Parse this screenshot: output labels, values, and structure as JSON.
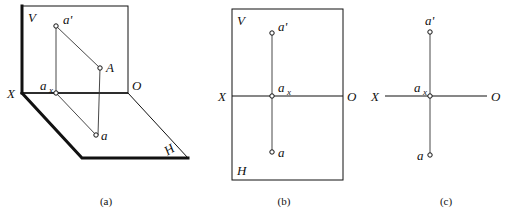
{
  "figure": {
    "background_color": "#ffffff",
    "line_color": "#111111",
    "panels": [
      {
        "id": "a",
        "caption": "(a)",
        "caption_x": 106,
        "caption_y": 205,
        "description": "Pictorial view: vertical plane V and horizontal plane H folded at axis XO",
        "labels": {
          "v_plane": "V",
          "h_plane": "H",
          "x_axis": "X",
          "o_origin": "O",
          "point_space": "A",
          "point_v_projection": "a'",
          "point_h_projection": "a",
          "point_axis": "a",
          "point_axis_sub": "x"
        },
        "points": [
          {
            "name": "a-prime",
            "label": "a'",
            "x": 56,
            "y": 26
          },
          {
            "name": "A",
            "label": "A",
            "x": 100,
            "y": 68
          },
          {
            "name": "a-x",
            "label": "a",
            "sub": "x",
            "x": 56,
            "y": 93
          },
          {
            "name": "a",
            "label": "a",
            "x": 96,
            "y": 135
          }
        ],
        "v_plane_rect": {
          "x1": 22,
          "y1": 6,
          "x2": 128,
          "y2": 93
        },
        "h_plane_points": "22,93 82,158 188,158 128,93",
        "axis_xo": {
          "x1": 22,
          "y1": 93,
          "x2": 128,
          "y2": 93
        }
      },
      {
        "id": "b",
        "caption": "(b)",
        "caption_x": 284,
        "caption_y": 205,
        "description": "Unfolded planes shown as one rectangle with axis XO across the middle",
        "labels": {
          "v_plane": "V",
          "h_plane": "H",
          "x_axis": "X",
          "o_origin": "O",
          "point_v_projection": "a'",
          "point_h_projection": "a",
          "point_axis": "a",
          "point_axis_sub": "x"
        },
        "points": [
          {
            "name": "a-prime",
            "label": "a'",
            "x": 272,
            "y": 33
          },
          {
            "name": "a-x",
            "label": "a",
            "sub": "x",
            "x": 272,
            "y": 96
          },
          {
            "name": "a",
            "label": "a",
            "x": 272,
            "y": 152
          }
        ],
        "frame_rect": {
          "x1": 232,
          "y1": 9,
          "x2": 343,
          "y2": 180
        },
        "axis_xo": {
          "x1": 232,
          "y1": 96,
          "x2": 343,
          "y2": 96
        }
      },
      {
        "id": "c",
        "caption": "(c)",
        "caption_x": 446,
        "caption_y": 205,
        "description": "Final two-view projection drawing with axis XO only",
        "labels": {
          "x_axis": "X",
          "o_origin": "O",
          "point_v_projection": "a'",
          "point_h_projection": "a",
          "point_axis": "a",
          "point_axis_sub": "x"
        },
        "points": [
          {
            "name": "a-prime",
            "label": "a'",
            "x": 430,
            "y": 32
          },
          {
            "name": "a-x",
            "label": "a",
            "sub": "x",
            "x": 430,
            "y": 96
          },
          {
            "name": "a",
            "label": "a",
            "x": 430,
            "y": 155
          }
        ],
        "axis_xo": {
          "x1": 385,
          "y1": 96,
          "x2": 487,
          "y2": 96
        },
        "axis_vertical": {
          "x1": 430,
          "y1": 32,
          "x2": 430,
          "y2": 155
        }
      }
    ]
  }
}
